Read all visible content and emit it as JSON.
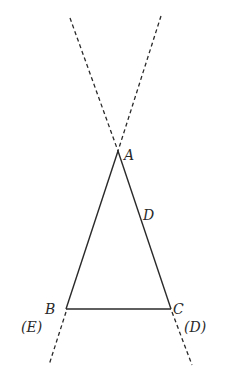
{
  "diagram": {
    "type": "geometry",
    "points": {
      "A": {
        "label": "A",
        "x": 118,
        "y": 151
      },
      "B": {
        "label": "B",
        "x": 66,
        "y": 309
      },
      "C": {
        "label": "C",
        "x": 171,
        "y": 309
      },
      "D": {
        "label": "D",
        "x": 145,
        "y": 212
      }
    },
    "labels": {
      "A": "A",
      "B": "B",
      "C": "C",
      "D_on_AC": "D",
      "E_line": "(E)",
      "D_line": "(D)"
    },
    "segments": [
      {
        "from": "A",
        "to": "B",
        "style": "solid"
      },
      {
        "from": "A",
        "to": "C",
        "style": "solid"
      },
      {
        "from": "B",
        "to": "C",
        "style": "solid"
      }
    ],
    "dashed_lines": [
      {
        "name": "(E)",
        "through": [
          "A",
          "B"
        ],
        "extends": "beyond A and beyond B"
      },
      {
        "name": "(D)",
        "through": [
          "A",
          "C"
        ],
        "extends": "beyond A and beyond C"
      }
    ],
    "colors": {
      "stroke": "#2a2a2a",
      "background": "#ffffff"
    }
  }
}
